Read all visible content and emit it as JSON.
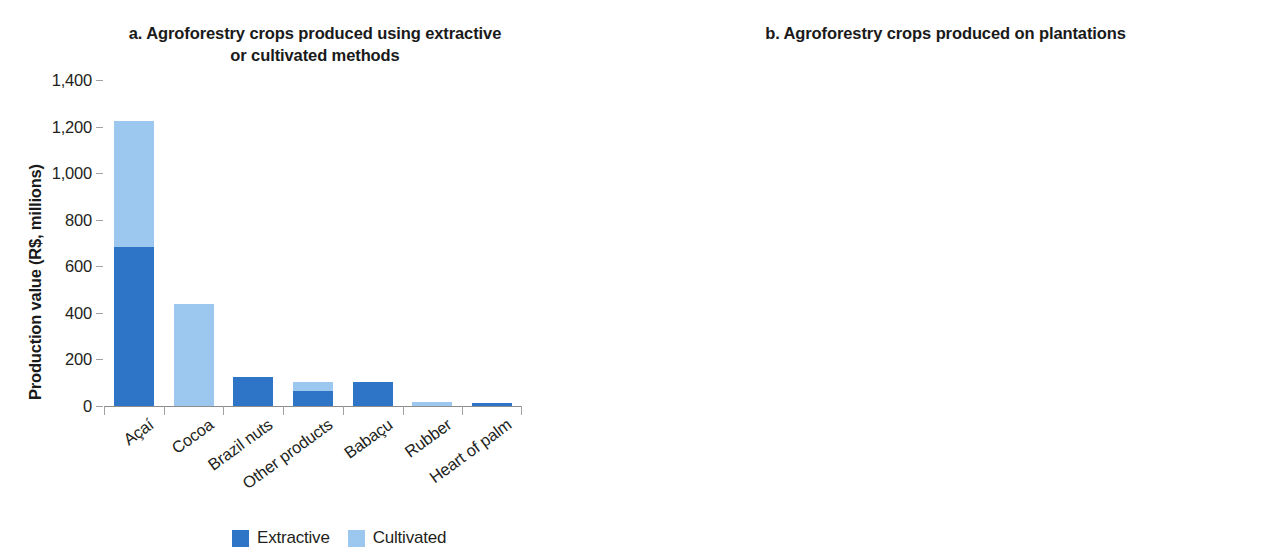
{
  "figure": {
    "background": "#ffffff",
    "colors": {
      "extractive": "#2E75C8",
      "cultivated": "#9CC8F0",
      "axis": "#8d8d8d",
      "text": "#231f20"
    }
  },
  "legend": {
    "position": "bottom-left",
    "items": [
      {
        "label": "Extractive",
        "color": "#2E75C8"
      },
      {
        "label": "Cultivated",
        "color": "#9CC8F0"
      }
    ]
  },
  "chart_data": [
    {
      "type": "bar",
      "stacked": true,
      "panel": "a",
      "title": "a. Agroforestry crops produced using extractive or cultivated methods",
      "title_line1": "a. Agroforestry crops produced using extractive",
      "title_line2": "or cultivated methods",
      "xlabel": "",
      "ylabel": "Production value (R$, millions)",
      "ylim": [
        0,
        1400
      ],
      "yticks": [
        0,
        200,
        400,
        600,
        800,
        1000,
        1200,
        1400
      ],
      "ytick_labels": [
        "0",
        "200",
        "400",
        "600",
        "800",
        "1,000",
        "1,200",
        "1,400"
      ],
      "grid": false,
      "legend_position": "below-figure",
      "categories": [
        "Açaí",
        "Cocoa",
        "Brazil nuts",
        "Other products",
        "Babaçu",
        "Rubber",
        "Heart of palm"
      ],
      "series": [
        {
          "name": "Extractive",
          "color": "#2E75C8",
          "values": [
            682,
            0,
            125,
            65,
            102,
            0,
            15
          ]
        },
        {
          "name": "Cultivated",
          "color": "#9CC8F0",
          "values": [
            542,
            438,
            0,
            40,
            0,
            16,
            0
          ]
        }
      ],
      "totals": [
        1224,
        438,
        125,
        105,
        102,
        16,
        15
      ]
    },
    {
      "type": "bar",
      "stacked": false,
      "panel": "b",
      "title": "b. Agroforestry crops produced on plantations",
      "title_line1": "b. Agroforestry crops produced on plantations",
      "title_line2": "",
      "xlabel": "",
      "ylabel": "Production value (R$, millions)",
      "ylim": [
        0,
        400
      ],
      "yticks": [
        0,
        50,
        100,
        150,
        200,
        250,
        300,
        350,
        400
      ],
      "ytick_labels": [
        "0",
        "50",
        "100",
        "150",
        "200",
        "250",
        "300",
        "350",
        "400"
      ],
      "grid": false,
      "legend_position": "none",
      "categories": [
        "Banana",
        "Dendê (coconut)",
        "Coffee (Canephora)",
        "Other products",
        "Black pepper",
        "Coconut",
        "Orange"
      ],
      "series": [
        {
          "name": "Plantation",
          "color": "#2E75C8",
          "values": [
            380,
            257,
            216,
            210,
            204,
            76,
            48
          ]
        }
      ],
      "values": [
        380,
        257,
        216,
        210,
        204,
        76,
        48
      ]
    }
  ]
}
